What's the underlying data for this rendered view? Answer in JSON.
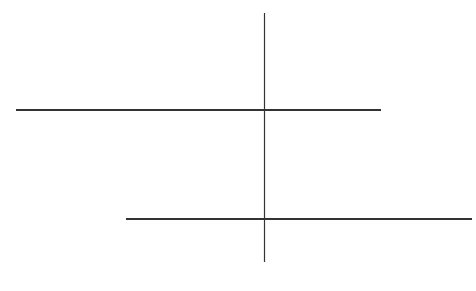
{
  "labels": {
    "null_true": [
      "Suppose the Null",
      "Hypothesis is true."
    ],
    "null_not_true": [
      "Suppose the Null",
      "Hypothesis is not true."
    ],
    "alpha": "α",
    "beta": "β",
    "power": "Power",
    "p0": "p",
    "p0_sub": "0",
    "p": "p",
    "p_star": "p*",
    "fail_to_reject": "Fail to reject H",
    "fail_to_reject_sub": "0",
    "reject": "Reject H",
    "reject_sub": "0"
  },
  "colors": {
    "fill_light": "#a9a9a9",
    "fill_dark": "#555555",
    "curve_stroke": "#5f5f5f",
    "axis": "#333333"
  },
  "chart_data": {
    "type": "area",
    "series": [
      {
        "name": "Null distribution (H0 true)",
        "center_label": "p0",
        "shaded_right_tail": "alpha",
        "annotation": "Suppose the Null Hypothesis is true."
      },
      {
        "name": "Alternative distribution (H0 false)",
        "center_label": "p",
        "shaded_left_region": "beta",
        "shaded_right_region": "Power",
        "annotation": "Suppose the Null Hypothesis is not true."
      }
    ],
    "critical_value": "p*",
    "regions": [
      "Fail to reject H0",
      "Reject H0"
    ],
    "ticks_per_axis": 7,
    "grid": false
  }
}
